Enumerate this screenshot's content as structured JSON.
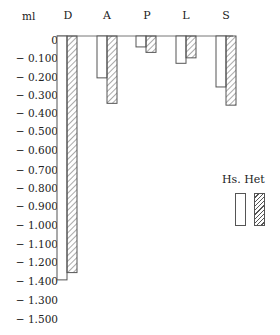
{
  "chart_data": {
    "type": "bar",
    "title": "",
    "ylabel": "ml",
    "xlabel": "",
    "categories": [
      "D",
      "A",
      "P",
      "L",
      "S"
    ],
    "series": [
      {
        "name": "Hs.",
        "style": "open",
        "values": [
          -1.34,
          -0.23,
          -0.06,
          -0.15,
          -0.28
        ]
      },
      {
        "name": "Het",
        "style": "hatched",
        "values": [
          -1.3,
          -0.37,
          -0.09,
          -0.12,
          -0.38
        ]
      }
    ],
    "ylim": [
      -1.5,
      0
    ],
    "yticks": [
      "0",
      "− 0.100",
      "− 0.200",
      "− 0.300",
      "− 0.400",
      "− 0.500",
      "− 0.600",
      "− 0.700",
      "− 0.800",
      "− 0.900",
      "− 1.000",
      "− 1.100",
      "− 1.200",
      "− 1.400",
      "− 1.300",
      "− 1.500"
    ],
    "grid": false,
    "legend": {
      "position": "right",
      "entries": [
        "Hs.",
        "Het"
      ]
    }
  },
  "legend_title": "Hs. Het",
  "colors": {
    "line": "#555555",
    "text": "#222222",
    "background": "#ffffff"
  }
}
